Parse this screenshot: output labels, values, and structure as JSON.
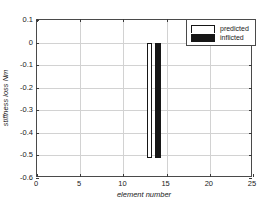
{
  "chart_data": {
    "type": "bar",
    "title": "",
    "xlabel": "element number",
    "ylabel": "stiffness loss Nm",
    "xlim": [
      0,
      25
    ],
    "ylim": [
      -0.6,
      0.1
    ],
    "grid": true,
    "legend_position": "top-right",
    "xticks": [
      "0",
      "5",
      "10",
      "15",
      "20",
      "25"
    ],
    "xtick_values": [
      0,
      5,
      10,
      15,
      20,
      25
    ],
    "yticks": [
      "0.1",
      "0",
      "-0.1",
      "-0.2",
      "-0.3",
      "-0.4",
      "-0.5",
      "-0.6"
    ],
    "ytick_values": [
      0.1,
      0,
      -0.1,
      -0.2,
      -0.3,
      -0.4,
      -0.5,
      -0.6
    ],
    "categories": [
      13,
      14
    ],
    "series": [
      {
        "name": "predicted",
        "color": "#ffffff",
        "edge_color": "#161616",
        "x": [
          13
        ],
        "values": [
          -0.51
        ]
      },
      {
        "name": "inflicted",
        "color": "#161616",
        "edge_color": "#161616",
        "x": [
          14
        ],
        "values": [
          -0.51
        ]
      }
    ],
    "legend": [
      {
        "label": "predicted",
        "swatch": "white"
      },
      {
        "label": "inflicted",
        "swatch": "black"
      }
    ]
  },
  "colors": {
    "axis": "#4a4a4a",
    "grid": "#d2d2d2",
    "text": "#1a1a1a",
    "bar_dark": "#161616",
    "background": "#ffffff"
  }
}
